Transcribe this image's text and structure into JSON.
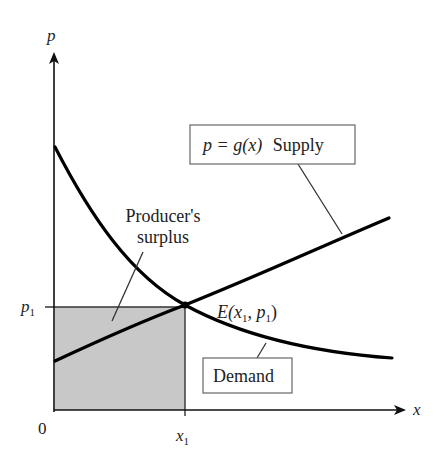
{
  "diagram": {
    "axes": {
      "y_label": "p",
      "x_label": "x",
      "origin_label": "0",
      "x_tick": {
        "base": "x",
        "subscript": "1"
      },
      "y_tick": {
        "base": "p",
        "subscript": "1"
      }
    },
    "curves": {
      "supply": {
        "name": "Supply",
        "equation": "p = g(x)",
        "shape": "increasing, slightly concave"
      },
      "demand": {
        "name": "Demand",
        "shape": "decreasing, convex"
      }
    },
    "labels": {
      "supply_box": {
        "math": "p = g(x)",
        "word": "Supply"
      },
      "demand_box": "Demand",
      "surplus_line1": "Producer's",
      "surplus_line2": "surplus",
      "equilibrium": {
        "prefix": "E(",
        "x": "x",
        "x_sub": "1",
        "sep": ", ",
        "p": "p",
        "p_sub": "1",
        "suffix": ")"
      }
    },
    "colors": {
      "shaded_region": "#c8c8c8",
      "curves": "#000000",
      "axes": "#111111"
    }
  }
}
